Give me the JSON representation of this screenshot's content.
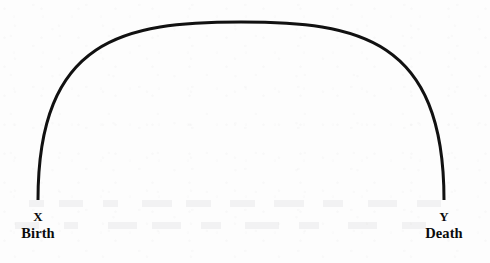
{
  "figure": {
    "type": "arc-diagram",
    "background_color": "#fdfdfd",
    "stroke_color": "#111111",
    "text_color": "#0b0b0b",
    "arc": {
      "shape": "semicircular-arc",
      "start_x": 38,
      "start_y": 200,
      "apex_x": 241,
      "apex_y": 22,
      "end_x": 444,
      "end_y": 200,
      "stroke_width": 3
    },
    "endpoints": [
      {
        "id": "left",
        "letter": "X",
        "caption": "Birth",
        "center_x": 38
      },
      {
        "id": "right",
        "letter": "Y",
        "caption": "Death",
        "center_x": 444
      }
    ]
  }
}
